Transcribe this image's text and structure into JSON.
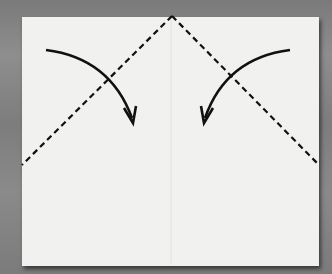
{
  "diagram": {
    "type": "origami-fold-instruction",
    "background_color": "#848484",
    "paper_color": "#f1f1f0",
    "line_color": "#111111",
    "paper": {
      "left": 22,
      "top": 17,
      "right": 319,
      "bottom": 266
    },
    "center_crease_x": 171,
    "valley_fold_lines": [
      {
        "from": [
          172,
          16
        ],
        "to": [
          22,
          165
        ],
        "style": "dashed"
      },
      {
        "from": [
          172,
          16
        ],
        "to": [
          319,
          165
        ],
        "style": "dashed"
      }
    ],
    "fold_arrows": [
      {
        "name": "left-corner-fold-arrow",
        "from": [
          46,
          50
        ],
        "to": [
          133,
          122
        ],
        "direction": "down-right"
      },
      {
        "name": "right-corner-fold-arrow",
        "from": [
          290,
          50
        ],
        "to": [
          204,
          122
        ],
        "direction": "down-left"
      }
    ]
  }
}
